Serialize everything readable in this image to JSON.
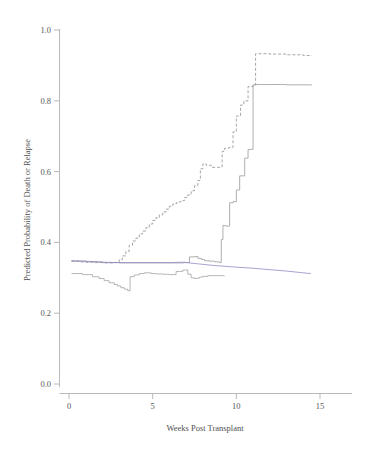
{
  "chart_data": {
    "type": "line",
    "title": "",
    "xlabel": "Weeks Post Transplant",
    "ylabel": "Predicted Probability of Death or Relapse",
    "xlim": [
      -0.5,
      16.5
    ],
    "ylim": [
      -0.04,
      1.06
    ],
    "xticks": [
      0,
      5,
      10,
      15
    ],
    "xticklabels": [
      "0",
      "5",
      "10",
      "15"
    ],
    "yticks": [
      0.0,
      0.2,
      0.4,
      0.6,
      0.8,
      1.0
    ],
    "yticklabels": [
      "0.0",
      "0.2",
      "0.4",
      "0.6",
      "0.8",
      "1.0"
    ],
    "grid": false,
    "legend": "none",
    "colors": {
      "dashed_upper": "#8f8f96",
      "solid_blue": "#8d8dc4",
      "solid_gray": "#9a9a9a",
      "axis": "#b9b9b9",
      "text": "#4f4f4f"
    },
    "series": [
      {
        "name": "upper-dashed-step",
        "style": "dashed",
        "color": "#8f8f96",
        "step": "post",
        "x": [
          0.15,
          0.6,
          1.0,
          1.5,
          2.0,
          2.4,
          2.7,
          3.0,
          3.2,
          3.4,
          3.6,
          3.8,
          4.0,
          4.2,
          4.4,
          4.6,
          4.8,
          5.0,
          5.2,
          5.4,
          5.6,
          5.8,
          6.0,
          6.2,
          6.4,
          6.6,
          6.8,
          6.9,
          7.1,
          7.3,
          7.5,
          7.7,
          7.85,
          8.0,
          8.2,
          8.5,
          8.8,
          9.0,
          9.15,
          9.3,
          9.55,
          9.8,
          10.0,
          10.25,
          10.45,
          10.7,
          11.0,
          11.15,
          12.0,
          13.0,
          14.0,
          14.5
        ],
        "y": [
          0.347,
          0.345,
          0.344,
          0.343,
          0.342,
          0.342,
          0.343,
          0.352,
          0.362,
          0.375,
          0.392,
          0.404,
          0.412,
          0.424,
          0.432,
          0.442,
          0.452,
          0.462,
          0.47,
          0.478,
          0.486,
          0.494,
          0.502,
          0.508,
          0.512,
          0.515,
          0.518,
          0.527,
          0.534,
          0.546,
          0.56,
          0.575,
          0.608,
          0.622,
          0.618,
          0.612,
          0.612,
          0.613,
          0.657,
          0.666,
          0.668,
          0.712,
          0.757,
          0.788,
          0.8,
          0.84,
          0.845,
          0.933,
          0.932,
          0.93,
          0.928,
          0.927
        ]
      },
      {
        "name": "middle-solid-step",
        "style": "solid",
        "color": "#9a9a9a",
        "step": "post",
        "x": [
          0.15,
          1.0,
          2.0,
          3.0,
          4.0,
          5.0,
          6.0,
          6.9,
          7.2,
          7.5,
          7.7,
          7.9,
          8.1,
          8.4,
          8.7,
          9.0,
          9.1,
          9.2,
          9.25,
          9.4,
          9.6,
          9.8,
          10.0,
          10.2,
          10.5,
          10.7,
          10.85,
          11.0,
          11.2,
          12.0,
          13.0,
          14.0,
          14.5
        ],
        "y": [
          0.347,
          0.345,
          0.343,
          0.342,
          0.342,
          0.342,
          0.342,
          0.343,
          0.359,
          0.36,
          0.355,
          0.352,
          0.348,
          0.347,
          0.345,
          0.343,
          0.408,
          0.448,
          0.447,
          0.446,
          0.512,
          0.515,
          0.548,
          0.588,
          0.638,
          0.662,
          0.663,
          0.845,
          0.846,
          0.846,
          0.845,
          0.845,
          0.844
        ]
      },
      {
        "name": "lower-solid-step",
        "style": "solid",
        "color": "#a5a5a5",
        "step": "post",
        "x": [
          0.15,
          0.8,
          1.4,
          1.8,
          2.1,
          2.4,
          2.7,
          2.9,
          3.1,
          3.3,
          3.5,
          3.58,
          3.65,
          3.9,
          4.2,
          4.5,
          4.9,
          5.2,
          5.6,
          6.0,
          6.4,
          6.8,
          6.95,
          7.1,
          7.3,
          7.5,
          7.65,
          7.8,
          8.0,
          8.3,
          8.6,
          8.9,
          9.1,
          9.2,
          9.3
        ],
        "y": [
          0.312,
          0.309,
          0.303,
          0.298,
          0.292,
          0.286,
          0.281,
          0.277,
          0.272,
          0.268,
          0.264,
          0.263,
          0.303,
          0.308,
          0.312,
          0.314,
          0.312,
          0.311,
          0.31,
          0.309,
          0.318,
          0.322,
          0.322,
          0.31,
          0.3,
          0.298,
          0.299,
          0.302,
          0.304,
          0.306,
          0.306,
          0.306,
          0.306,
          0.306,
          0.306
        ]
      },
      {
        "name": "flat-blue-line",
        "style": "solid",
        "color": "#8d8dc4",
        "step": "linear",
        "x": [
          0.15,
          1.0,
          2.0,
          3.0,
          4.0,
          5.0,
          6.0,
          6.9,
          7.2,
          7.6,
          8.0,
          8.6,
          9.2,
          10.0,
          11.0,
          12.0,
          13.0,
          14.0,
          14.45
        ],
        "y": [
          0.348,
          0.347,
          0.344,
          0.343,
          0.343,
          0.343,
          0.343,
          0.344,
          0.342,
          0.34,
          0.338,
          0.335,
          0.333,
          0.33,
          0.327,
          0.323,
          0.319,
          0.314,
          0.312
        ]
      }
    ]
  },
  "axes": {
    "x_title": "Weeks Post Transplant",
    "y_title": "Predicted Probability of Death or Relapse"
  }
}
